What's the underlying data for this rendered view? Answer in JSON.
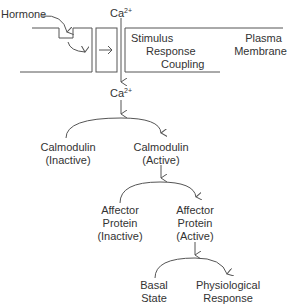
{
  "diagram": {
    "hormone": "Hormone",
    "calcium_top": {
      "base": "Ca",
      "charge": "2+"
    },
    "calcium_mid": {
      "base": "Ca",
      "charge": "2+"
    },
    "stimulus": [
      "Stimulus",
      "Response",
      "Coupling"
    ],
    "plasma_membrane": [
      "Plasma",
      "Membrane"
    ],
    "calmodulin_inactive": [
      "Calmodulin",
      "(Inactive)"
    ],
    "calmodulin_active": [
      "Calmodulin",
      "(Active)"
    ],
    "affector_inactive": [
      "Affector",
      "Protein",
      "(Inactive)"
    ],
    "affector_active": [
      "Affector",
      "Protein",
      "(Active)"
    ],
    "basal_state": [
      "Basal",
      "State"
    ],
    "physiological_response": [
      "Physiological",
      "Response"
    ],
    "line_color": "#555555"
  }
}
